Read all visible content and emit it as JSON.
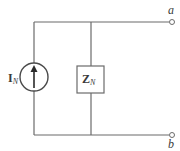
{
  "diagram": {
    "source": {
      "label_main": "I",
      "label_sub": "N",
      "type": "current-source",
      "direction": "up"
    },
    "impedance": {
      "label_main": "Z",
      "label_sub": "N"
    },
    "terminals": [
      {
        "id": "a",
        "label": "a"
      },
      {
        "id": "b",
        "label": "b"
      }
    ],
    "colors": {
      "wire": "#6b6b6b",
      "text": "#3a3a3a",
      "background": "#ffffff"
    }
  }
}
